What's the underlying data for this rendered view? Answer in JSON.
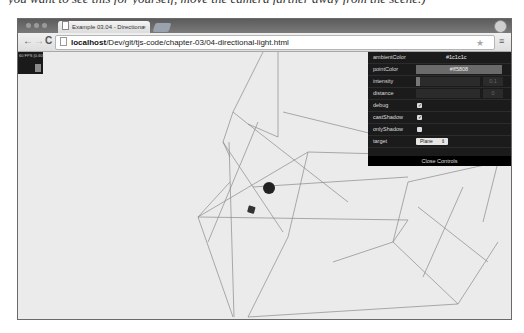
{
  "book_text": "you want to see this for yourself, move the camera farther away from the scene.)",
  "browser": {
    "tab": {
      "title": "Example 03.04 - Directiona",
      "close_glyph": "×"
    },
    "nav": {
      "back_glyph": "←",
      "forward_glyph": "→",
      "reload_glyph": "C"
    },
    "address_bar": {
      "host": "localhost",
      "path": "/Dev/git/tjs-code/chapter-03/04-directional-light.html"
    },
    "star_glyph": "★",
    "menu_glyph": "≡"
  },
  "stats": {
    "fps_text": "60 FPS (0-60)"
  },
  "gui": {
    "rows": [
      {
        "label": "ambientColor",
        "value": "#1c1c1c"
      },
      {
        "label": "pointColor",
        "value": "#ff5808"
      },
      {
        "label": "intensity",
        "value": "0.1",
        "fill_pct": 6
      },
      {
        "label": "distance",
        "value": "0",
        "fill_pct": 0
      },
      {
        "label": "debug",
        "checked": true
      },
      {
        "label": "castShadow",
        "checked": true
      },
      {
        "label": "onlyShadow",
        "checked": false
      },
      {
        "label": "target",
        "value": "Plane"
      }
    ],
    "check_glyph": "✓",
    "select_arrow": "⇕",
    "close_label": "Close Controls"
  },
  "colors": {
    "viewport_bg": "#ebebeb",
    "gui_bg": "#1b1b1b",
    "wire_color": "#8a8a8a"
  }
}
